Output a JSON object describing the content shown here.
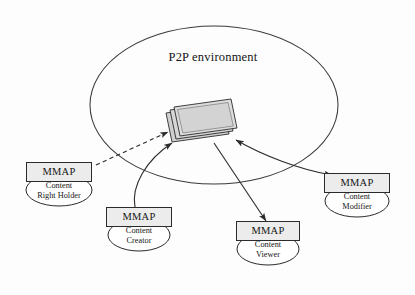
{
  "figure": {
    "environment": {
      "label": "P2P environment",
      "shape": "ellipse"
    },
    "center_icon": {
      "name": "content-stack-icon",
      "description": "stack of three content sheets",
      "sheet_count": 3,
      "fill_color": "#d4d4d4",
      "stroke_color": "#2b2b2b"
    },
    "nodes": [
      {
        "id": "content-right-holder",
        "box_label": "MMAP",
        "role_label": "Content\nRight Holder"
      },
      {
        "id": "content-creator",
        "box_label": "MMAP",
        "role_label": "Content\nCreator"
      },
      {
        "id": "content-viewer",
        "box_label": "MMAP",
        "role_label": "Content\nViewer"
      },
      {
        "id": "content-modifier",
        "box_label": "MMAP",
        "role_label": "Content\nModifier"
      }
    ],
    "connections": [
      {
        "id": "right-holder-to-content",
        "from": "content-right-holder",
        "to": "content-stack-icon",
        "style": "dashed",
        "arrow": "to-content"
      },
      {
        "id": "creator-to-content",
        "from": "content-creator",
        "to": "content-stack-icon",
        "style": "solid",
        "arrow": "to-content"
      },
      {
        "id": "content-to-viewer",
        "from": "content-stack-icon",
        "to": "content-viewer",
        "style": "solid",
        "arrow": "to-node"
      },
      {
        "id": "modifier-to-content",
        "from": "content-modifier",
        "to": "content-stack-icon",
        "style": "solid",
        "arrow": "both"
      }
    ],
    "colors": {
      "line": "#2b2b2b",
      "box_fill": "#ececec",
      "icon_fill": "#d4d4d4",
      "background": "#fdfdfd"
    }
  }
}
